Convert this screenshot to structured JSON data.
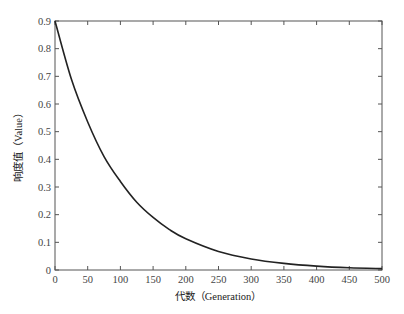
{
  "chart_data": {
    "type": "line",
    "title": "",
    "xlabel": "代数（Generation）",
    "ylabel": "响度值（Value）",
    "xlim": [
      0,
      500
    ],
    "ylim": [
      0,
      0.9
    ],
    "xticks": [
      0,
      50,
      100,
      150,
      200,
      250,
      300,
      350,
      400,
      450,
      500
    ],
    "yticks": [
      0,
      0.1,
      0.2,
      0.3,
      0.4,
      0.5,
      0.6,
      0.7,
      0.8,
      0.9
    ],
    "xtick_labels": [
      "0",
      "50",
      "100",
      "150",
      "200",
      "250",
      "300",
      "350",
      "400",
      "450",
      "500"
    ],
    "ytick_labels": [
      "0",
      "0.1",
      "0.2",
      "0.3",
      "0.4",
      "0.5",
      "0.6",
      "0.7",
      "0.8",
      "0.9"
    ],
    "grid": false,
    "legend": null,
    "series": [
      {
        "name": "Value",
        "color": "#222222",
        "x": [
          0,
          25,
          50,
          75,
          100,
          125,
          150,
          175,
          200,
          250,
          300,
          350,
          400,
          450,
          500
        ],
        "values": [
          0.9,
          0.69,
          0.535,
          0.41,
          0.32,
          0.245,
          0.19,
          0.146,
          0.113,
          0.067,
          0.04,
          0.024,
          0.014,
          0.008,
          0.005
        ]
      }
    ]
  }
}
